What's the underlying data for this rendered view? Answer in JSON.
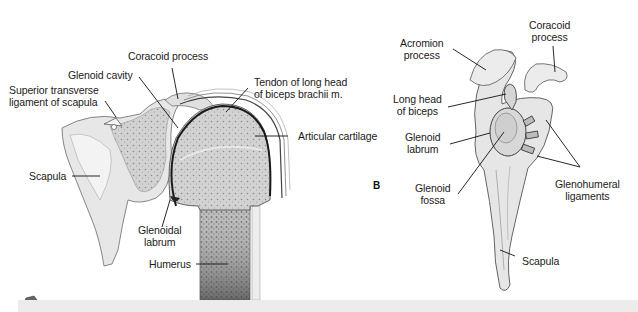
{
  "figure_a": {
    "labels": {
      "coracoid_process": "Coracoid process",
      "glenoid_cavity": "Glenoid cavity",
      "superior_transverse_line1": "Superior transverse",
      "superior_transverse_line2": "ligament of scapula",
      "tendon_line1": "Tendon of long head",
      "tendon_line2": "of biceps brachii m.",
      "articular_cartilage": "Articular cartilage",
      "scapula": "Scapula",
      "glenoidal_labrum_line1": "Glenoidal",
      "glenoidal_labrum_line2": "labrum",
      "humerus": "Humerus"
    }
  },
  "figure_b": {
    "panel_letter": "B",
    "labels": {
      "acromion_line1": "Acromion",
      "acromion_line2": "process",
      "coracoid_line1": "Coracoid",
      "coracoid_line2": "process",
      "long_head_line1": "Long head",
      "long_head_line2": "of biceps",
      "glenoid_labrum_line1": "Glenoid",
      "glenoid_labrum_line2": "labrum",
      "glenoid_fossa_line1": "Glenoid",
      "glenoid_fossa_line2": "fossa",
      "glenohumeral_line1": "Glenohumeral",
      "glenohumeral_line2": "ligaments",
      "scapula": "Scapula"
    }
  },
  "colors": {
    "bone_fill": "#e4e4e4",
    "spongy_fill": "#c9c9c9",
    "outline": "#555555",
    "leader": "#111111",
    "footer_bar": "#ececec"
  }
}
